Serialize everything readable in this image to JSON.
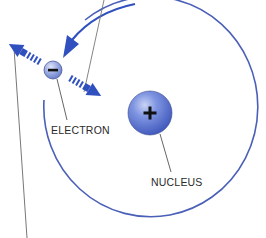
{
  "diagram": {
    "type": "atom-model",
    "labels": {
      "electron": "ELECTRON",
      "nucleus": "NUCLEUS"
    },
    "symbols": {
      "electron_charge": "−",
      "nucleus_charge": "+"
    },
    "colors": {
      "orbit": "#4a5fb8",
      "arrow": "#3050c0",
      "electron_fill": "#7f93d8",
      "nucleus_fill": "#4a66d0",
      "leader_line": "#666666",
      "text": "#2a2a2a"
    },
    "elements": [
      {
        "id": "orbit",
        "kind": "circle-arc",
        "description": "electron orbit path"
      },
      {
        "id": "electron",
        "kind": "sphere",
        "charge": "negative"
      },
      {
        "id": "nucleus",
        "kind": "sphere",
        "charge": "positive"
      },
      {
        "id": "arrow-outward",
        "kind": "striped-arrow",
        "direction": "up-left"
      },
      {
        "id": "arrow-inward",
        "kind": "striped-arrow",
        "direction": "down-right"
      },
      {
        "id": "arrow-orbit",
        "kind": "curved-arrow",
        "direction": "toward electron"
      }
    ]
  }
}
